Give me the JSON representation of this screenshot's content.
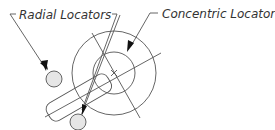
{
  "labels": {
    "radial": "Radial Locators",
    "concentric": "Concentric Locator"
  },
  "colors": {
    "line": "#555555",
    "locator_fill": "#e6e6e6",
    "arrow": "#111111",
    "text": "#333333"
  },
  "geometry": {
    "center": [
      114,
      73
    ],
    "outer_radius": 42,
    "inner_radius": 21,
    "radial_locators": [
      {
        "cx": 54,
        "cy": 77,
        "r": 8
      },
      {
        "cx": 78,
        "cy": 122,
        "r": 8
      }
    ]
  }
}
